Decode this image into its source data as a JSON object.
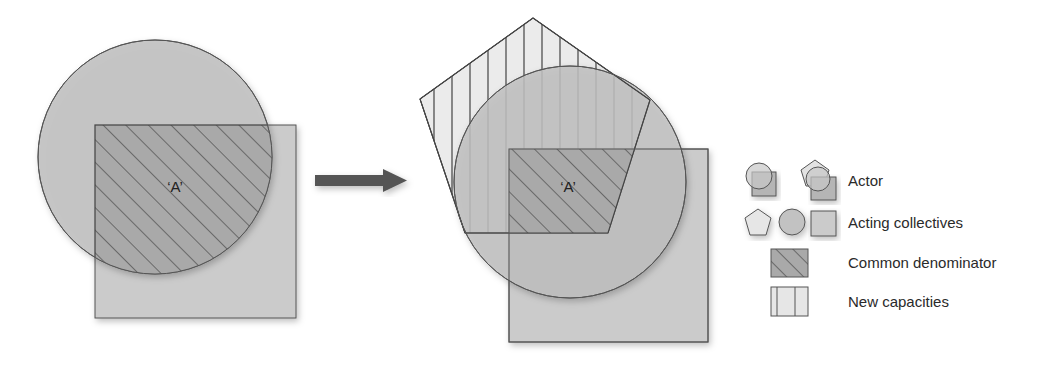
{
  "diagram": {
    "before": {
      "label": "‘A’"
    },
    "after": {
      "label": "‘A’"
    },
    "arrow": {
      "direction": "right"
    },
    "colors": {
      "circle_fill": "#c2c2c2",
      "square_fill": "#cbcbcb",
      "overlap_fill": "#a9a9a9",
      "pentagon_fill": "#e6e6e6",
      "stroke": "#555555",
      "arrow": "#555555"
    }
  },
  "legend": {
    "items": [
      {
        "label": "Actor",
        "icon": "actor-icon"
      },
      {
        "label": "Acting collectives",
        "icon": "acting-collectives-icon"
      },
      {
        "label": "Common denominator",
        "icon": "diagonal-hatch-icon"
      },
      {
        "label": "New capacities",
        "icon": "vertical-hatch-icon"
      }
    ]
  }
}
